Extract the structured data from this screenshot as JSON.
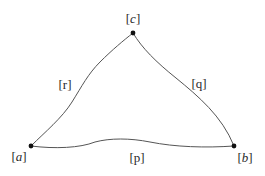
{
  "diagram": {
    "type": "curved-triangle",
    "colors": {
      "background": "#ffffff",
      "edge": "#555555",
      "vertex": "#111111",
      "label": "#2a2a2a"
    },
    "vertices": [
      {
        "id": "a",
        "label_open": "[",
        "label_var": "a",
        "label_close": "]",
        "x": 31,
        "y": 146
      },
      {
        "id": "b",
        "label_open": "[",
        "label_var": "b",
        "label_close": "]",
        "x": 234,
        "y": 146
      },
      {
        "id": "c",
        "label_open": "[",
        "label_var": "c",
        "label_close": "]",
        "x": 133,
        "y": 33
      }
    ],
    "edges": [
      {
        "id": "r",
        "label": "[r]",
        "from": "a",
        "to": "c"
      },
      {
        "id": "q",
        "label": "[q]",
        "from": "c",
        "to": "b"
      },
      {
        "id": "p",
        "label": "[p]",
        "from": "a",
        "to": "b"
      }
    ]
  }
}
